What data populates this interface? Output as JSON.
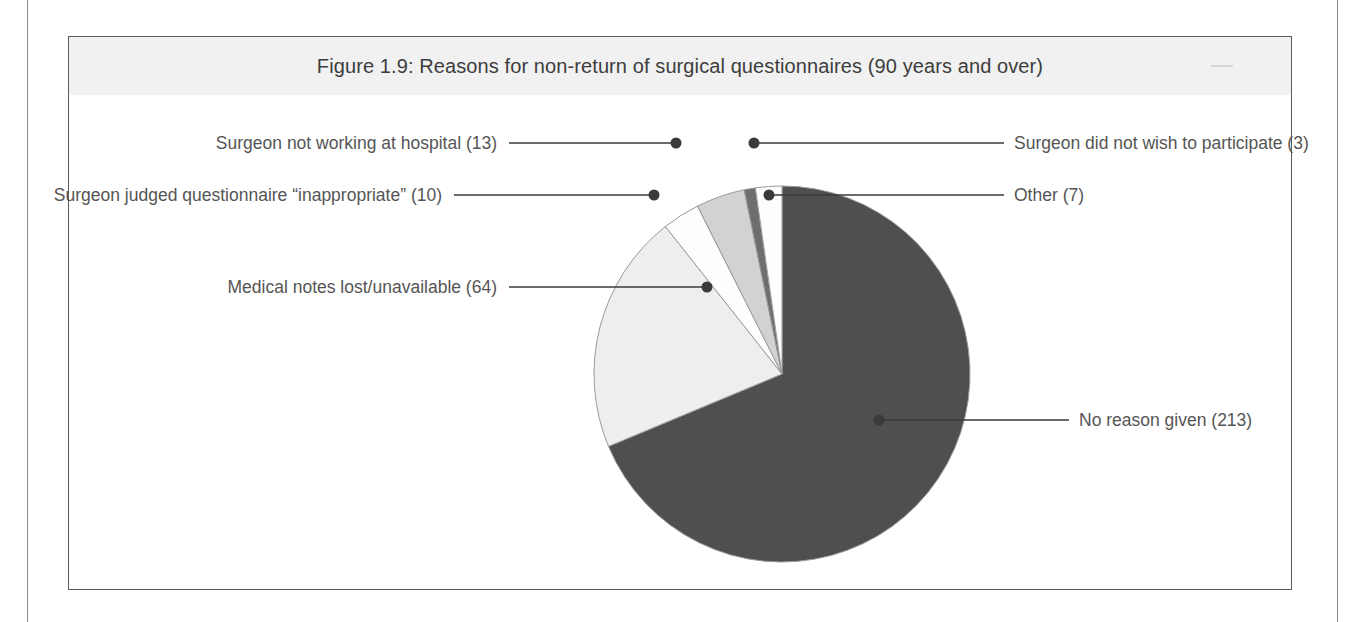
{
  "figure": {
    "title": "Figure 1.9: Reasons for non-return of surgical questionnaires (90 years and over)"
  },
  "colors": {
    "slice_dark": "#4f4f4f",
    "slice_light": "#eeeeee",
    "slice_white": "#fdfdfd",
    "slice_midgray": "#d2d2d2",
    "slice_darkgray": "#6e6e6e",
    "outline": "#9a9a9a",
    "leader": "#3a3a3a",
    "title_band": "#f1f1f1",
    "frame": "#5a5a5a",
    "text": "#555555"
  },
  "labels": {
    "no_reason_given": "No reason given (213)",
    "medical_notes": "Medical notes lost/unavailable (64)",
    "inappropriate": "Surgeon judged questionnaire “inappropriate” (10)",
    "not_working": "Surgeon not working at hospital (13)",
    "did_not_wish": "Surgeon did not wish to participate (3)",
    "other": "Other (7)"
  },
  "chart_data": {
    "type": "pie",
    "title": "Figure 1.9: Reasons for non-return of surgical questionnaires (90 years and over)",
    "total": 310,
    "legend_position": "callout-labels",
    "slices": [
      {
        "label": "No reason given",
        "value": 213,
        "display_label": "No reason given (213)",
        "percent": 68.7,
        "color": "#4f4f4f"
      },
      {
        "label": "Medical notes lost/unavailable",
        "value": 64,
        "display_label": "Medical notes lost/unavailable (64)",
        "percent": 20.6,
        "color": "#eeeeee"
      },
      {
        "label": "Surgeon judged questionnaire “inappropriate”",
        "value": 10,
        "display_label": "Surgeon judged questionnaire “inappropriate” (10)",
        "percent": 3.2,
        "color": "#fdfdfd"
      },
      {
        "label": "Surgeon not working at hospital",
        "value": 13,
        "display_label": "Surgeon not working at hospital (13)",
        "percent": 4.2,
        "color": "#d2d2d2"
      },
      {
        "label": "Surgeon did not wish to participate",
        "value": 3,
        "display_label": "Surgeon did not wish to participate (3)",
        "percent": 1.0,
        "color": "#6e6e6e"
      },
      {
        "label": "Other",
        "value": 7,
        "display_label": "Other (7)",
        "percent": 2.3,
        "color": "#fdfdfd"
      }
    ]
  }
}
